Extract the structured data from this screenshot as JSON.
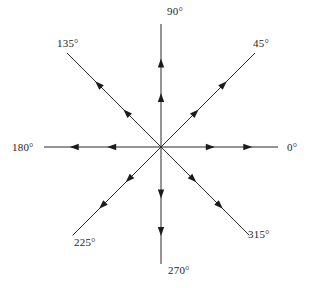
{
  "figure": {
    "name": "compass-angle-diagram",
    "background_color": "#ffffff",
    "line_color": "#2b2b2b",
    "arrow_color": "#1c1c1c",
    "label_color": "#252525",
    "center": {
      "x": 161,
      "y": 147
    }
  },
  "chart_data": {
    "type": "scatter",
    "title": "",
    "subtitle": "",
    "xlabel": "",
    "ylabel": "",
    "grid": false,
    "legend": "none",
    "origin": {
      "x": 161,
      "y": 147
    },
    "ray_count": 8,
    "arrowheads_per_ray": 2,
    "arrow_direction": "outward",
    "angle_unit": "degrees",
    "categories": [
      "0°",
      "45°",
      "90°",
      "135°",
      "180°",
      "225°",
      "270°",
      "315°"
    ],
    "values": [
      0,
      45,
      90,
      135,
      180,
      225,
      270,
      315
    ],
    "rays": [
      {
        "id": "ray-0",
        "angle_deg": 0,
        "label": "0°",
        "dir_x": 1,
        "dir_y": 0,
        "length": 117,
        "label_x": 287,
        "label_y": 141,
        "arrow_positions": [
          0.46,
          0.78
        ]
      },
      {
        "id": "ray-45",
        "angle_deg": 45,
        "label": "45°",
        "dir_x": 0.7071,
        "dir_y": -0.7071,
        "length": 133,
        "label_x": 253,
        "label_y": 37,
        "arrow_positions": [
          0.4,
          0.7
        ]
      },
      {
        "id": "ray-90",
        "angle_deg": 90,
        "label": "90°",
        "dir_x": 0,
        "dir_y": -1,
        "length": 123,
        "label_x": 167,
        "label_y": 5,
        "arrow_positions": [
          0.44,
          0.72
        ]
      },
      {
        "id": "ray-135",
        "angle_deg": 135,
        "label": "135°",
        "dir_x": -0.7071,
        "dir_y": -0.7071,
        "length": 133,
        "label_x": 57,
        "label_y": 37,
        "arrow_positions": [
          0.4,
          0.7
        ]
      },
      {
        "id": "ray-180",
        "angle_deg": 180,
        "label": "180°",
        "dir_x": -1,
        "dir_y": 0,
        "length": 117,
        "label_x": 12,
        "label_y": 141,
        "arrow_positions": [
          0.46,
          0.78
        ]
      },
      {
        "id": "ray-225",
        "angle_deg": 225,
        "label": "225°",
        "dir_x": -0.7071,
        "dir_y": 0.7071,
        "length": 125,
        "label_x": 74,
        "label_y": 236,
        "arrow_positions": [
          0.4,
          0.7
        ]
      },
      {
        "id": "ray-270",
        "angle_deg": 270,
        "label": "270°",
        "dir_x": 0,
        "dir_y": 1,
        "length": 117,
        "label_x": 168,
        "label_y": 264,
        "arrow_positions": [
          0.44,
          0.76
        ]
      },
      {
        "id": "ray-315",
        "angle_deg": 315,
        "label": "315°",
        "dir_x": 0.7071,
        "dir_y": 0.7071,
        "length": 125,
        "label_x": 248,
        "label_y": 228,
        "arrow_positions": [
          0.4,
          0.7
        ]
      }
    ]
  }
}
